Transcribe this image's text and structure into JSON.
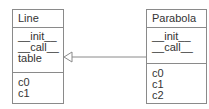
{
  "diagram": {
    "type": "uml-class-diagram",
    "classes": [
      {
        "name": "Line",
        "methods": [
          "__init__",
          "__call__",
          "table"
        ],
        "attributes": [
          "c0",
          "c1"
        ]
      },
      {
        "name": "Parabola",
        "methods": [
          "__init__",
          "__call__"
        ],
        "attributes": [
          "c0",
          "c1",
          "c2"
        ]
      }
    ],
    "relations": [
      {
        "from": "Parabola",
        "to": "Line",
        "kind": "inheritance"
      }
    ],
    "colors": {
      "border": "#8a8a8a",
      "text": "#333333",
      "background": "#ffffff"
    }
  }
}
